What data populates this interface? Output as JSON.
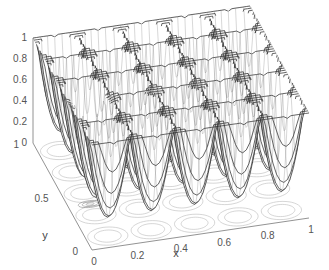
{
  "chart_data": {
    "type": "surface",
    "subtype": "mesh with contour (meshc)",
    "title": "",
    "xlabel": "x",
    "ylabel": "y",
    "zlabel": "",
    "xlim": [
      0,
      1
    ],
    "ylim": [
      0,
      1
    ],
    "zlim": [
      0,
      1
    ],
    "xticks": [
      "0",
      "0.2",
      "0.4",
      "0.6",
      "0.8",
      "1"
    ],
    "yticks": [
      "0",
      "0.5",
      "1"
    ],
    "zticks": [
      "0",
      "0.2",
      "0.4",
      "0.6",
      "0.8",
      "1"
    ],
    "grid": false,
    "legend": null,
    "surface_description": "Periodic egg-crate surface with ~5x5 grid of bowl-shaped wells; well minima mostly ~0.1-0.3, ridges/peaks reach ~1.0; deep global minimum (~0) near x=0.1, y=0.4",
    "periods": {
      "x": 5,
      "y": 5
    },
    "global_minimum": {
      "x": 0.1,
      "y": 0.4,
      "z": 0.0
    },
    "max_value": 1.0,
    "mesh_color": "#222222",
    "face_color": "#ffffff",
    "contour_color": "#bbbbbb"
  }
}
